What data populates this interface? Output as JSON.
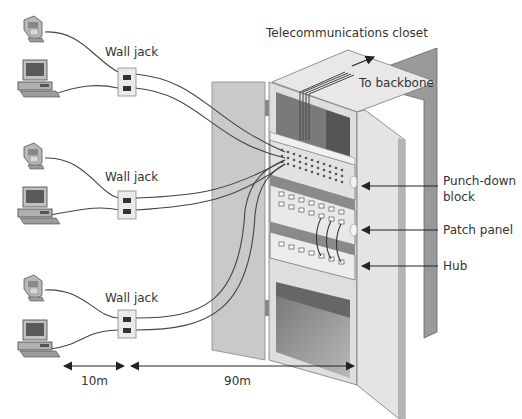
{
  "diagram": {
    "title": "Telecommunications closet",
    "labels": {
      "backbone": "To backbone",
      "punch_down": [
        "Punch-down",
        "block"
      ],
      "patch_panel": "Patch panel",
      "hub": "Hub"
    },
    "workstations": [
      {
        "jack_label": "Wall jack",
        "devices": [
          "telephone",
          "computer"
        ]
      },
      {
        "jack_label": "Wall jack",
        "devices": [
          "telephone",
          "computer"
        ]
      },
      {
        "jack_label": "Wall jack",
        "devices": [
          "telephone",
          "computer"
        ]
      }
    ],
    "distances": {
      "device_to_jack": "10m",
      "jack_to_closet": "90m"
    },
    "colors": {
      "cabinet_light": "#e6e6e6",
      "cabinet_mid": "#c8c8c8",
      "cabinet_dark": "#8c8c8c",
      "interior_dark": "#6e6e6e",
      "cable": "#444444",
      "text": "#333333"
    }
  }
}
